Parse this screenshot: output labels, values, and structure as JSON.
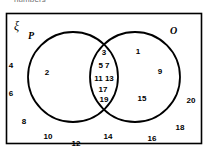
{
  "caption": {
    "text": "numbers"
  },
  "diagram": {
    "type": "venn-two-set",
    "universe_symbol": "ξ",
    "set_labels": {
      "left": "P",
      "right": "O"
    },
    "regions": {
      "left_only": {
        "name": "P only",
        "values": [
          "2"
        ]
      },
      "intersection": {
        "name": "P and O",
        "rows": [
          [
            "3"
          ],
          [
            "5",
            "7"
          ],
          [
            "11",
            "13"
          ],
          [
            "17"
          ],
          [
            "19"
          ]
        ],
        "values": [
          "3",
          "5",
          "7",
          "11",
          "13",
          "17",
          "19"
        ]
      },
      "right_only": {
        "name": "O only",
        "values": [
          "1",
          "9",
          "15"
        ]
      },
      "outside": {
        "name": "outside both sets",
        "values": [
          "4",
          "6",
          "8",
          "10",
          "12",
          "14",
          "16",
          "18",
          "20"
        ]
      }
    },
    "placed_numbers": [
      {
        "text": "4",
        "x": 11,
        "y": 66,
        "region": "outside"
      },
      {
        "text": "6",
        "x": 11,
        "y": 94,
        "region": "outside"
      },
      {
        "text": "8",
        "x": 24,
        "y": 122,
        "region": "outside"
      },
      {
        "text": "10",
        "x": 48,
        "y": 137,
        "region": "outside"
      },
      {
        "text": "12",
        "x": 76,
        "y": 144,
        "region": "outside"
      },
      {
        "text": "14",
        "x": 108,
        "y": 137,
        "region": "outside"
      },
      {
        "text": "16",
        "x": 152,
        "y": 139,
        "region": "outside"
      },
      {
        "text": "18",
        "x": 180,
        "y": 128,
        "region": "outside"
      },
      {
        "text": "20",
        "x": 191,
        "y": 101,
        "region": "outside"
      },
      {
        "text": "2",
        "x": 47,
        "y": 73,
        "region": "left_only"
      },
      {
        "text": "3",
        "x": 104,
        "y": 53,
        "region": "intersection"
      },
      {
        "text": "5  7",
        "x": 104,
        "y": 66,
        "region": "intersection"
      },
      {
        "text": "11 13",
        "x": 104,
        "y": 79,
        "region": "intersection"
      },
      {
        "text": "17",
        "x": 103,
        "y": 90,
        "region": "intersection"
      },
      {
        "text": "19",
        "x": 104,
        "y": 100,
        "region": "intersection"
      },
      {
        "text": "1",
        "x": 138,
        "y": 52,
        "region": "right_only"
      },
      {
        "text": "9",
        "x": 160,
        "y": 72,
        "region": "right_only"
      },
      {
        "text": "15",
        "x": 142,
        "y": 99,
        "region": "right_only"
      }
    ],
    "geometry": {
      "frame": {
        "x": 6,
        "y": 13,
        "w": 196,
        "h": 131
      },
      "left_circle": {
        "cx": 73,
        "cy": 77,
        "r": 45
      },
      "right_circle": {
        "cx": 135,
        "cy": 77,
        "r": 45
      }
    },
    "colors": {
      "stroke": "#000000",
      "background": "#ffffff",
      "caption_text": "#6f6f6f"
    }
  }
}
